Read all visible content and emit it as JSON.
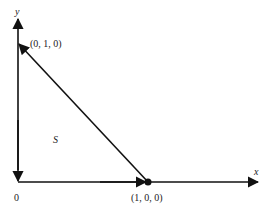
{
  "diagram": {
    "axes": {
      "x_label": "x",
      "y_label": "y",
      "origin_label": "0"
    },
    "points": {
      "top": "(0, 1, 0)",
      "right": "(1, 0, 0)"
    },
    "region_label": "S",
    "colors": {
      "stroke": "#111111",
      "text": "#222222",
      "background": "#ffffff"
    }
  }
}
